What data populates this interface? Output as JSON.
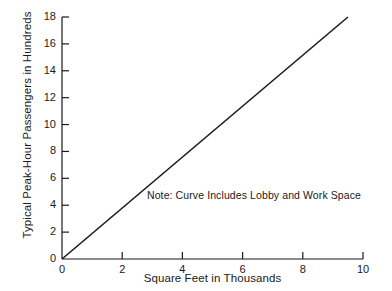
{
  "chart_data": {
    "type": "line",
    "title": "",
    "xlabel": "Square Feet in Thousands",
    "ylabel": "Typical Peak-Hour Passengers in Hundreds",
    "xlim": [
      0,
      10
    ],
    "ylim": [
      0,
      18
    ],
    "xticks": [
      0,
      2,
      4,
      6,
      8,
      10
    ],
    "xtick_labels": [
      "0",
      "2",
      "4",
      "6",
      "8",
      "10"
    ],
    "yticks": [
      0,
      2,
      4,
      6,
      8,
      10,
      12,
      14,
      16,
      18
    ],
    "ytick_labels": [
      "0",
      "2",
      "4",
      "6",
      "8",
      "10",
      "12",
      "14",
      "16",
      "18"
    ],
    "grid": false,
    "legend": null,
    "line_color": "#1a1a1a",
    "series": [
      {
        "name": "Typical peak-hour passengers vs floor area",
        "x": [
          0,
          9.5
        ],
        "y": [
          0,
          18
        ]
      }
    ],
    "annotations": [
      {
        "name": "curve-note",
        "text": "Note: Curve Includes Lobby and Work Space",
        "x": 3.0,
        "y": 5.2
      }
    ]
  },
  "axis": {
    "ylabel_text": "Typical Peak-Hour Passengers in Hundreds",
    "xlabel_text": "Square Feet in Thousands"
  },
  "note": {
    "text": "Note: Curve Includes Lobby and Work Space"
  },
  "colors": {
    "background": "#ffffff",
    "ink": "#1a1a1a"
  }
}
